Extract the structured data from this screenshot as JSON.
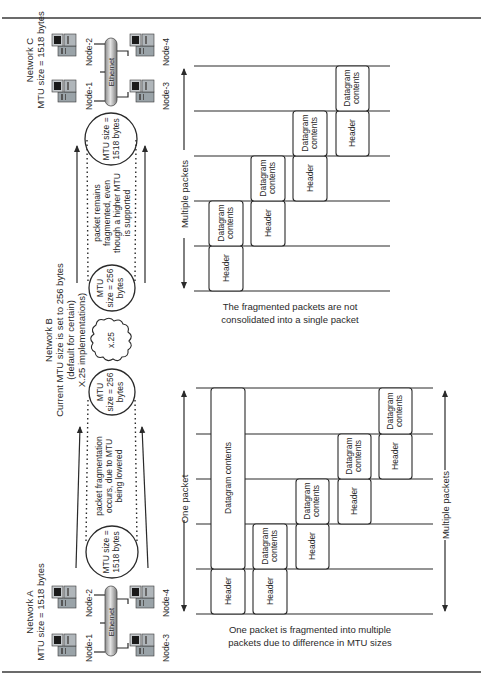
{
  "figure": {
    "orientation": "rotated 90 degrees counter-clockwise",
    "networks": {
      "a": {
        "title": "Network A",
        "mtu": "MTU size = 1518 bytes",
        "medium": "Ethernet",
        "nodes": [
          "Node-1",
          "Node-2",
          "Node-3",
          "Node-4"
        ]
      },
      "b": {
        "title": "Network B",
        "mtu_line1": "Current MTU size is set to 256 bytes",
        "mtu_line2": "(default for certain)",
        "mtu_line3": "X.25 implementations)",
        "cloud_label": "x.25"
      },
      "c": {
        "title": "Network C",
        "mtu": "MTU size = 1518 bytes",
        "medium": "Ethernet",
        "nodes": [
          "Node-1",
          "Node-2",
          "Node-3",
          "Node-4"
        ]
      }
    },
    "circles": {
      "a_line1": "MTU size =",
      "a_line2": "1518 bytes",
      "b_left_line1": "MTU",
      "b_left_line2": "size = 256",
      "b_left_line3": "bytes",
      "b_right_line1": "MTU",
      "b_right_line2": "size = 256",
      "b_right_line3": "bytes",
      "c_line1": "MTU size =",
      "c_line2": "1518 bytes"
    },
    "notes": {
      "fragmentation_line1": "packet fragmentation",
      "fragmentation_line2": "occurs, due to MTU",
      "fragmentation_line3": "being lowered",
      "remains_line1": "packet remains",
      "remains_line2": "fragmented, even",
      "remains_line3": "though a higher MTU",
      "remains_line4": "is supported"
    },
    "bottom_diagram": {
      "left_label": "One packet",
      "right_label": "Multiple packets",
      "caption_line1": "One packet is fragmented into multiple",
      "caption_line2": "packets due to difference in MTU sizes",
      "original_packet": {
        "header": "Header",
        "contents": "Datagram contents"
      },
      "fragments": [
        {
          "header": "Header",
          "contents_line1": "Datagram",
          "contents_line2": "contents"
        },
        {
          "header": "Header",
          "contents_line1": "Datagram",
          "contents_line2": "contents"
        },
        {
          "header": "Header",
          "contents_line1": "Datagram",
          "contents_line2": "contents"
        },
        {
          "header": "Header",
          "contents_line1": "Datagram",
          "contents_line2": "contents"
        }
      ]
    },
    "top_diagram": {
      "label": "Multiple packets",
      "caption_line1": "The fragmented packets are not",
      "caption_line2": "consolidated into a single packet",
      "fragments": [
        {
          "header": "Header",
          "contents_line1": "Datagram",
          "contents_line2": "contents"
        },
        {
          "header": "Header",
          "contents_line1": "Datagram",
          "contents_line2": "contents"
        },
        {
          "header": "Header",
          "contents_line1": "Datagram",
          "contents_line2": "contents"
        },
        {
          "header": "Header",
          "contents_line1": "Datagram",
          "contents_line2": "contents"
        }
      ]
    }
  }
}
